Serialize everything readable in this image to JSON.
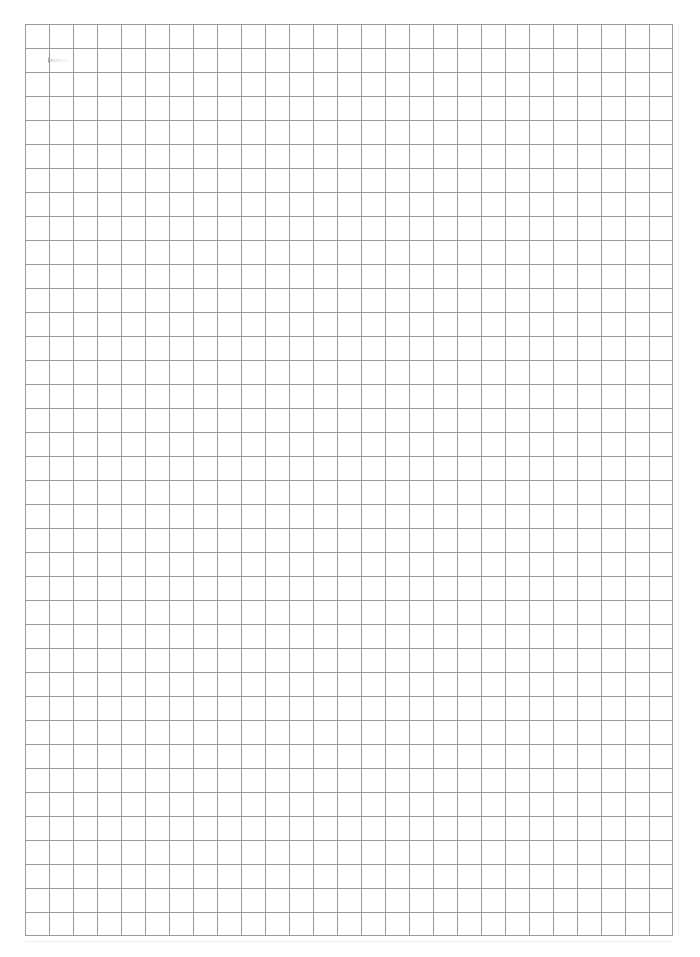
{
  "document": {
    "title": "Blank grid paper sheet",
    "kind": "scanned-graph-paper",
    "page_width_px": 700,
    "page_height_px": 957,
    "page_background": "#ffffff",
    "text_content": ""
  },
  "grid": {
    "name": "square-grid",
    "origin_x_px": 25,
    "origin_y_px": 24,
    "width_px": 648,
    "height_px": 912,
    "columns": 27,
    "rows": 38,
    "cell_size_px": 24,
    "line_color": "#9b9b9b",
    "line_width_px": 1,
    "ghost_line_color": "#ededed"
  },
  "marks": {
    "pencil_streak": {
      "name": "faint-pencil-streak",
      "x_px": 48,
      "y_px": 59,
      "width_px": 25,
      "height_px": 3,
      "color": "#969696",
      "description": ""
    }
  },
  "margins": {
    "left_px": 25,
    "top_px": 24,
    "right_px": 27,
    "bottom_px": 21
  }
}
